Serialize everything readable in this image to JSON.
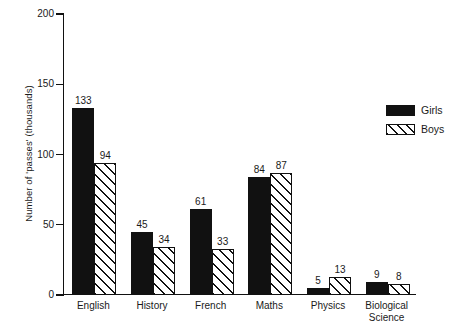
{
  "chart_data": {
    "type": "bar",
    "title": "",
    "xlabel": "",
    "ylabel": "Number of 'passes' (thousands)",
    "ylim": [
      0,
      200
    ],
    "yticks": [
      0,
      50,
      100,
      150,
      200
    ],
    "ytick_labels": [
      "0",
      "50",
      "100",
      "150",
      "200"
    ],
    "grid": false,
    "legend_position": "right",
    "categories": [
      "English",
      "History",
      "French",
      "Maths",
      "Physics",
      "Biological\nScience"
    ],
    "series": [
      {
        "name": "Girls",
        "fill": "solid-black",
        "color": "#111111",
        "values": [
          133,
          45,
          61,
          84,
          5,
          9
        ]
      },
      {
        "name": "Boys",
        "fill": "diagonal-hatch",
        "color": "#111111",
        "values": [
          94,
          34,
          33,
          87,
          13,
          8
        ]
      }
    ]
  },
  "legend": {
    "entries": [
      {
        "label": "Girls",
        "swatch": "solid-black-swatch"
      },
      {
        "label": "Boys",
        "swatch": "hatched-swatch"
      }
    ]
  }
}
